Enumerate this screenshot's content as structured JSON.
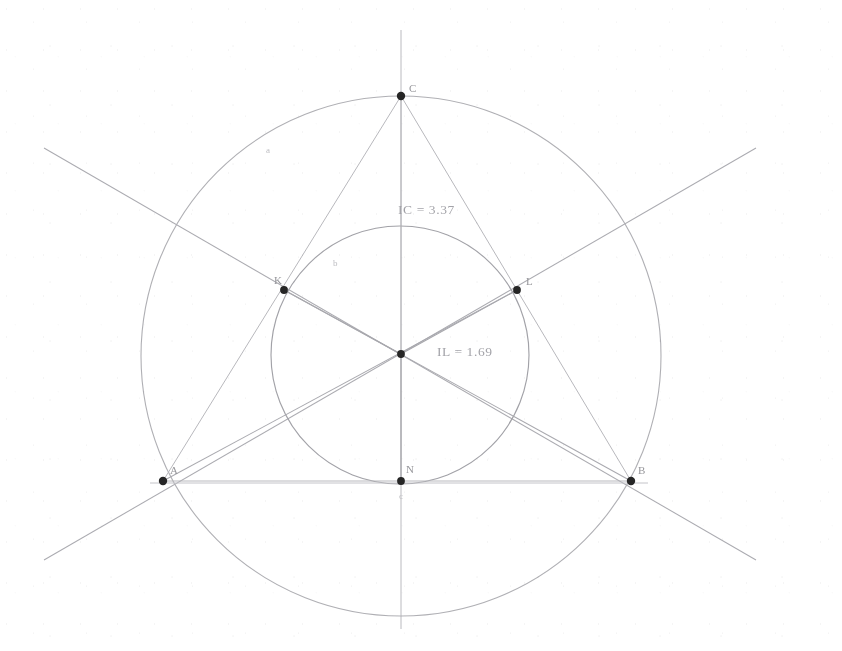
{
  "figure": {
    "kind": "euclidean-geometry-construction",
    "background_color": "#ffffff",
    "stroke_color": "#9a9aa0",
    "faint_stroke_color": "#c3c3c8",
    "point_color": "#1a1a1a",
    "label_color": "#8d8d92",
    "measure_color": "#9b9ba1",
    "width": 842,
    "height": 651
  },
  "measurements": [
    {
      "id": "ic",
      "text": "IC = 3.37",
      "x": 398,
      "y": 214
    },
    {
      "id": "il",
      "text": "IL = 1.69",
      "x": 437,
      "y": 355
    }
  ],
  "points": [
    {
      "id": "C",
      "label": "C",
      "x": 401,
      "y": 96,
      "label_dx": 8,
      "label_dy": -4,
      "radius": 4.2
    },
    {
      "id": "A",
      "label": "A",
      "x": 163,
      "y": 481,
      "label_dx": 7,
      "label_dy": -7,
      "radius": 4.2
    },
    {
      "id": "B",
      "label": "B",
      "x": 631,
      "y": 481,
      "label_dx": 7,
      "label_dy": -7,
      "radius": 4.2
    },
    {
      "id": "I",
      "label": "",
      "x": 401,
      "y": 354,
      "label_dx": 8,
      "label_dy": -4,
      "radius": 3.8
    },
    {
      "id": "K",
      "label": "K",
      "x": 284,
      "y": 290,
      "label_dx": -10,
      "label_dy": -6,
      "radius": 3.8
    },
    {
      "id": "L",
      "label": "L",
      "x": 517,
      "y": 290,
      "label_dx": 9,
      "label_dy": -5,
      "radius": 3.8
    },
    {
      "id": "N",
      "label": "N",
      "x": 401,
      "y": 481,
      "label_dx": 5,
      "label_dy": -8,
      "radius": 3.8
    }
  ],
  "faint_labels": [
    {
      "id": "arc-a",
      "label": "a",
      "x": 266,
      "y": 153
    },
    {
      "id": "arc-b",
      "label": "b",
      "x": 333,
      "y": 266
    },
    {
      "id": "below-n",
      "label": "c",
      "x": 402,
      "y": 497
    }
  ],
  "circles": [
    {
      "id": "circumcircle",
      "cx": 401,
      "cy": 356,
      "r": 260,
      "stroke": "#a9a9ae",
      "width": 1.1
    },
    {
      "id": "incircle",
      "cx": 400,
      "cy": 355,
      "r": 129,
      "stroke": "#9a9aa0",
      "width": 1.1
    }
  ],
  "triangle": {
    "id": "triangle-ABC",
    "vertices": [
      {
        "x": 401,
        "y": 96
      },
      {
        "x": 163,
        "y": 481
      },
      {
        "x": 631,
        "y": 481
      }
    ],
    "stroke": "#b0b0b5",
    "width": 1.0
  },
  "bisector_lines": [
    {
      "id": "bisector-vertical",
      "x1": 401,
      "y1": 30,
      "x2": 401,
      "y2": 629
    },
    {
      "id": "bisector-left-down",
      "x1": 44,
      "y1": 148,
      "x2": 756,
      "y2": 560
    },
    {
      "id": "bisector-right-down",
      "x1": 756,
      "y1": 148,
      "x2": 44,
      "y2": 560
    }
  ],
  "base_line": {
    "id": "base-AB",
    "x1": 150,
    "y1": 483,
    "x2": 648,
    "y2": 483
  }
}
